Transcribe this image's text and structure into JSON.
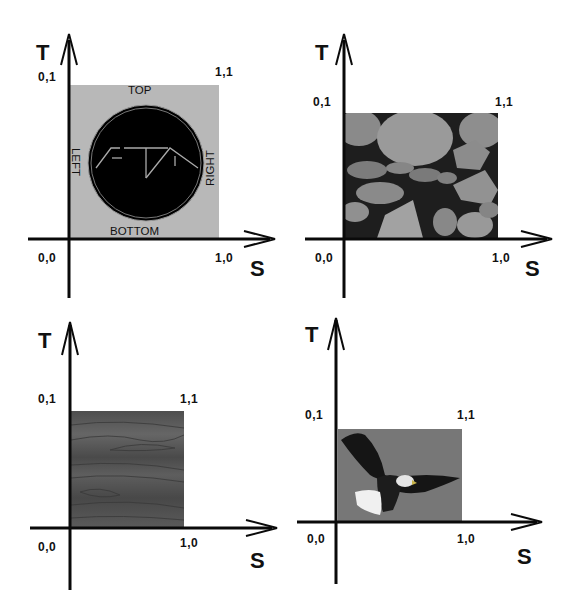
{
  "figure": {
    "colors": {
      "axis": "#0a0a0a",
      "background": "#ffffff",
      "label": "#111111"
    },
    "panels": [
      {
        "id": "logo-panel",
        "axis_labels": {
          "t": "T",
          "s": "S"
        },
        "corners": {
          "origin": "0,0",
          "top_left": "0,1",
          "top_right": "1,1",
          "bottom_right": "1,0"
        },
        "texture": "logo-badge",
        "texture_color": "#b8b8b8",
        "edge_labels": {
          "top": "TOP",
          "bottom": "BOTTOM",
          "left": "LEFT",
          "right": "RIGHT"
        }
      },
      {
        "id": "stone-panel",
        "axis_labels": {
          "t": "T",
          "s": "S"
        },
        "corners": {
          "origin": "0,0",
          "top_left": "0,1",
          "top_right": "1,1",
          "bottom_right": "1,0"
        },
        "texture": "stone-wall",
        "texture_color": "#7a7a7a"
      },
      {
        "id": "wood-panel",
        "axis_labels": {
          "t": "T",
          "s": "S"
        },
        "corners": {
          "origin": "0,0",
          "top_left": "0,1",
          "top_right": "1,1",
          "bottom_right": "1,0"
        },
        "texture": "wood-grain",
        "texture_color": "#5a5a5a"
      },
      {
        "id": "eagle-panel",
        "axis_labels": {
          "t": "T",
          "s": "S"
        },
        "corners": {
          "origin": "0,0",
          "top_left": "0,1",
          "top_right": "1,1",
          "bottom_right": "1,0"
        },
        "texture": "bald-eagle-photo",
        "texture_color": "#777777"
      }
    ]
  }
}
